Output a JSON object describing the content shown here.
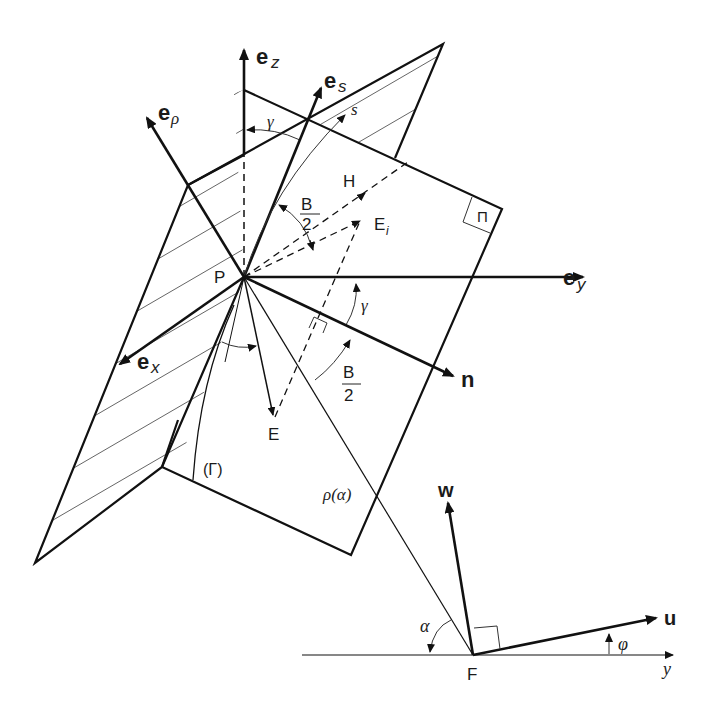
{
  "figure": {
    "colors": {
      "stroke": "#111111",
      "hatch": "#555555",
      "background": "#ffffff"
    }
  },
  "points": {
    "P": "P",
    "F": "F",
    "H": "H",
    "E": "E",
    "E_i_base": "E",
    "E_i_sub": "i"
  },
  "vectors": {
    "e_z": {
      "base": "e",
      "sub": "z"
    },
    "e_s": {
      "base": "e",
      "sub": "s"
    },
    "e_rho": {
      "base": "e",
      "sub": "ρ"
    },
    "e_y": {
      "base": "e",
      "sub": "y"
    },
    "e_x": {
      "base": "e",
      "sub": "x"
    },
    "n": "n",
    "w": "w",
    "u": "u"
  },
  "angles": {
    "gamma_top": "γ",
    "gamma_right": "γ",
    "half_B_top": {
      "num": "B",
      "den": "2"
    },
    "half_B_bottom": {
      "num": "B",
      "den": "2"
    },
    "alpha": "α",
    "phi": "φ"
  },
  "curves": {
    "s": "s",
    "Gamma": "(Γ)",
    "rho_alpha": "ρ(α)"
  },
  "planes": {
    "Pi": "Π"
  },
  "axes": {
    "y": "y"
  }
}
